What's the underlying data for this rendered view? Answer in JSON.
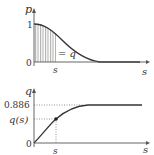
{
  "top_plot": {
    "y_axis_label": "p",
    "x_axis_label": "s",
    "y_tick_one": "1",
    "y_tick_zero": "0",
    "x_tick": "s",
    "area_annotation": "= q"
  },
  "bottom_plot": {
    "y_axis_label": "q",
    "x_axis_label": "s",
    "y_tick_asymptote": "0.886",
    "y_tick_point": "q(s)",
    "y_tick_zero": "0",
    "x_tick": "s"
  },
  "colors": {
    "curve": "#333333",
    "hatch": "#888888",
    "dotted": "#777777"
  }
}
